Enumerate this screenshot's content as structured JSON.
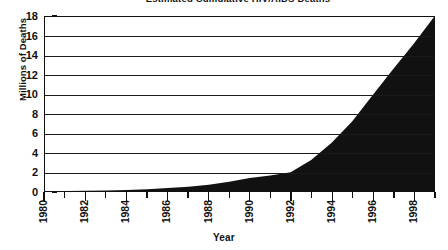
{
  "chart_data": {
    "type": "area",
    "title": "Estimated Cumulative HIV/AIDS Deaths",
    "xlabel": "Year",
    "ylabel": "Millions of Deaths",
    "xlim": [
      1980,
      1999
    ],
    "ylim": [
      0,
      18
    ],
    "grid": true,
    "legend": "none",
    "fill_color": "#111111",
    "x_tick_labels": [
      "1980",
      "1982",
      "1984",
      "1986",
      "1988",
      "1990",
      "1992",
      "1994",
      "1996",
      "1998"
    ],
    "y_tick_labels": [
      "0",
      "2",
      "4",
      "6",
      "8",
      "10",
      "12",
      "14",
      "16",
      "18"
    ],
    "x": [
      1980,
      1981,
      1982,
      1983,
      1984,
      1985,
      1986,
      1987,
      1988,
      1989,
      1990,
      1991,
      1992,
      1993,
      1994,
      1995,
      1996,
      1997,
      1998,
      1999
    ],
    "values": [
      0.0,
      0.0,
      0.02,
      0.05,
      0.1,
      0.18,
      0.3,
      0.45,
      0.65,
      0.95,
      1.35,
      1.6,
      1.95,
      3.2,
      5.0,
      7.2,
      9.9,
      12.6,
      15.2,
      18.0
    ],
    "series": [
      {
        "name": "Cumulative Deaths",
        "values": [
          0.0,
          0.0,
          0.02,
          0.05,
          0.1,
          0.18,
          0.3,
          0.45,
          0.65,
          0.95,
          1.35,
          1.6,
          1.95,
          3.2,
          5.0,
          7.2,
          9.9,
          12.6,
          15.2,
          18.0
        ]
      }
    ]
  },
  "axes": {
    "y_title": "Millions of Deaths",
    "x_title": "Year",
    "y_ticks": [
      {
        "label": "18",
        "value": 18
      },
      {
        "label": "16",
        "value": 16
      },
      {
        "label": "14",
        "value": 14
      },
      {
        "label": "12",
        "value": 12
      },
      {
        "label": "10",
        "value": 10
      },
      {
        "label": "8",
        "value": 8
      },
      {
        "label": "6",
        "value": 6
      },
      {
        "label": "4",
        "value": 4
      },
      {
        "label": "2",
        "value": 2
      },
      {
        "label": "0",
        "value": 0
      }
    ],
    "x_ticks": [
      {
        "label": "1980",
        "value": 1980
      },
      {
        "label": "",
        "value": 1981
      },
      {
        "label": "1982",
        "value": 1982
      },
      {
        "label": "",
        "value": 1983
      },
      {
        "label": "1984",
        "value": 1984
      },
      {
        "label": "",
        "value": 1985
      },
      {
        "label": "1986",
        "value": 1986
      },
      {
        "label": "",
        "value": 1987
      },
      {
        "label": "1988",
        "value": 1988
      },
      {
        "label": "",
        "value": 1989
      },
      {
        "label": "1990",
        "value": 1990
      },
      {
        "label": "",
        "value": 1991
      },
      {
        "label": "1992",
        "value": 1992
      },
      {
        "label": "",
        "value": 1993
      },
      {
        "label": "1994",
        "value": 1994
      },
      {
        "label": "",
        "value": 1995
      },
      {
        "label": "1996",
        "value": 1996
      },
      {
        "label": "",
        "value": 1997
      },
      {
        "label": "1998",
        "value": 1998
      },
      {
        "label": "",
        "value": 1999
      }
    ]
  }
}
